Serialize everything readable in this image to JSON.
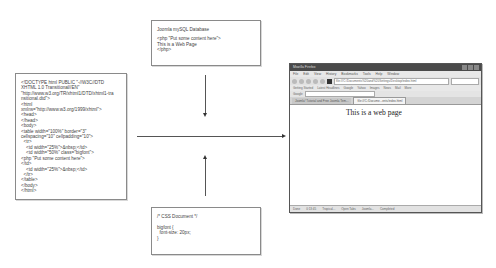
{
  "diagram": {
    "html_box": {
      "lines": [
        "<!DOCTYPE html PUBLIC \"-//W3C//DTD",
        "XHTML 1.0 Transitional//EN\"",
        "\"http://www.w3.org/TR/xhtml1/DTD/xhtml1-tra",
        "nsitional.dtd\">",
        "<html",
        "xmlns=\"http://www.w3.org/1999/xhtml\">",
        "<head>",
        "</head>",
        "<body>",
        "<table width=\"100%\" border=\"3\"",
        "cellspacing=\"10\" cellpadding=\"10\">",
        "  <tr>",
        "    <td width=\"25%\">&nbsp;</td>",
        "    <td width=\"50%\" class=\"bigfont\">",
        "<php \"Put some content here\">",
        "</td>",
        "    <td width=\"25%\">&nbsp;</td>",
        "  </tr>",
        "</table>",
        "</body>",
        "</html>"
      ]
    },
    "db_box": {
      "title": "Joomla mySQL Database",
      "lines": [
        "<php \"Put some content here\">",
        "This is a Web Page",
        "</php>"
      ]
    },
    "css_box": {
      "lines": [
        "/* CSS Document */",
        "",
        "bigfont {",
        "  font-size: 20px;",
        "}"
      ]
    },
    "arrows": [
      {
        "from": "html_box",
        "to": "browser",
        "direction": "right"
      },
      {
        "from": "db_box",
        "to": "center",
        "direction": "down"
      },
      {
        "from": "css_box",
        "to": "center",
        "direction": "up"
      }
    ],
    "colors": {
      "line": "#555555",
      "box_border": "#8a8a8a",
      "titlebar": "#4a4a4a"
    }
  },
  "browser": {
    "title": "Mozilla Firefox",
    "menu": [
      "File",
      "Edit",
      "View",
      "History",
      "Bookmarks",
      "Tools",
      "Help",
      "Window"
    ],
    "url": "file:///C:/Documents%20and%20Settings/Desktop/index.html",
    "bookmarks": [
      "Getting Started",
      "Latest Headlines",
      "Google",
      "Yahoo",
      "Images",
      "News",
      "Mail",
      "More"
    ],
    "toolbar_label": "Google",
    "tabs": [
      "Joomla! Tutorial and Free Joomla Tem...",
      "file:///C:/Docume...ents/index.html"
    ],
    "content_text": "This is a web page",
    "status": [
      "Done",
      "0:13:45",
      "Tropical...",
      "Open Tabs",
      "Joomla...",
      "Completed"
    ]
  }
}
